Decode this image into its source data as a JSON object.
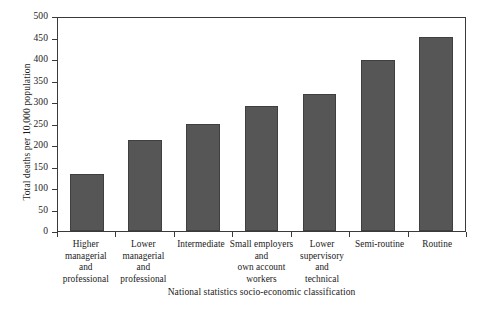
{
  "chart_data": {
    "type": "bar",
    "title": "",
    "xlabel": "National statistics socio-economic classification",
    "ylabel": "Total deaths per 10,000 population",
    "ylim": [
      0,
      500
    ],
    "ytick_step": 50,
    "yticks": [
      "0",
      "50",
      "100",
      "150",
      "200",
      "250",
      "300",
      "350",
      "400",
      "450",
      "500"
    ],
    "grid": false,
    "legend": null,
    "bar_color": "#565656",
    "bar_edge_color": "#3f3f3f",
    "axis_color": "#3a3a3a",
    "categories": [
      "Higher managerial and professional",
      "Lower managerial and professional",
      "Intermediate",
      "Small employers and own account workers",
      "Lower supervisory and technical",
      "Semi-routine",
      "Routine"
    ],
    "category_lines": [
      [
        "Higher",
        "managerial",
        "and",
        "professional"
      ],
      [
        "Lower",
        "managerial",
        "and",
        "professional"
      ],
      [
        "Intermediate"
      ],
      [
        "Small employers",
        "and",
        "own account",
        "workers"
      ],
      [
        "Lower",
        "supervisory",
        "and",
        "technical"
      ],
      [
        "Semi-routine"
      ],
      [
        "Routine"
      ]
    ],
    "values": [
      135,
      214,
      251,
      294,
      321,
      402,
      456
    ]
  }
}
